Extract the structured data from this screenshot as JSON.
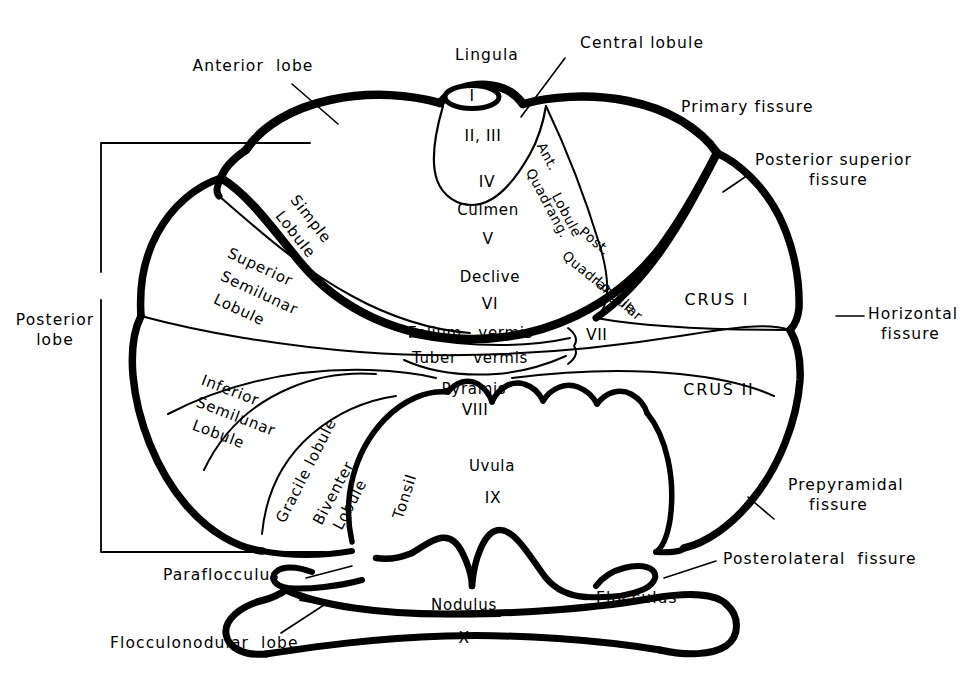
{
  "figure": {
    "ink": "#000000",
    "background": "#ffffff"
  },
  "lobe_brackets": [
    {
      "name": "anterior-lobe",
      "label": "Anterior  lobe"
    },
    {
      "name": "posterior-lobe",
      "label_line1": "Posterior",
      "label_line2": "lobe"
    },
    {
      "name": "flocculonodular-lobe",
      "label": "Flocculonodular  lobe"
    }
  ],
  "callouts": {
    "anterior_lobe": "Anterior  lobe",
    "lingula": "Lingula",
    "central_lobule": "Central lobule",
    "primary_fissure": "Primary fissure",
    "posterior_superior_fissure_l1": "Posterior superior",
    "posterior_superior_fissure_l2": "fissure",
    "horizontal_fissure_l1": "Horizontal",
    "horizontal_fissure_l2": "fissure",
    "prepyramidal_fissure_l1": "Prepyramidal",
    "prepyramidal_fissure_l2": "fissure",
    "posterolateral_fissure": "Posterolateral  fissure",
    "paraflocculus": "Paraflocculus",
    "flocculonodular_lobe": "Flocculonodular  lobe",
    "posterior_lobe_l1": "Posterior",
    "posterior_lobe_l2": "lobe"
  },
  "hemisphere_regions": {
    "simple_lobule_l1": "Simple",
    "simple_lobule_l2": "Lobule",
    "superior_semilunar_l1": "Superior",
    "superior_semilunar_l2": "Semilunar",
    "superior_semilunar_l3": "Lobule",
    "inferior_semilunar_l1": "Inferior",
    "inferior_semilunar_l2": "Semilunar",
    "inferior_semilunar_l3": "Lobule",
    "gracile_lobule": "Gracile lobule",
    "biventer_l1": "Biventer",
    "biventer_l2": "Lobule",
    "tonsil": "Tonsil",
    "ant_quadrangular_l1": "Ant.",
    "ant_quadrangular_l2": "Quadrang.",
    "ant_quadrangular_l3": "Lobule",
    "post_quadrangular_l1": "Post.",
    "post_quadrangular_l2": "Quadrangular",
    "post_quadrangular_l3": "Lobule",
    "crus_i": "CRUS I",
    "crus_ii": "CRUS II",
    "flocculus": "Flocculus"
  },
  "vermis_segments": [
    {
      "name": "lingula",
      "label": "",
      "roman": "I"
    },
    {
      "name": "central-lobule",
      "label": "",
      "roman": "II, III"
    },
    {
      "name": "culmen",
      "label": "Culmen",
      "roman_above": "IV",
      "roman_below": "V"
    },
    {
      "name": "declive",
      "label": "Declive",
      "roman": "VI"
    },
    {
      "name": "folium-vermis",
      "label": "Folium   vermis",
      "roman": "VII"
    },
    {
      "name": "tuber-vermis",
      "label": "Tuber   vermis",
      "roman": ""
    },
    {
      "name": "pyramis",
      "label": "Pyramis",
      "roman": "VIII"
    },
    {
      "name": "uvula",
      "label": "Uvula",
      "roman": "IX"
    },
    {
      "name": "nodulus",
      "label": "Nodulus",
      "roman": "X"
    }
  ],
  "roman_numerals": {
    "i": "I",
    "ii_iii": "II, III",
    "iv": "IV",
    "v": "V",
    "vi": "VI",
    "vii": "VII",
    "viii": "VIII",
    "ix": "IX",
    "x": "X"
  },
  "vermis_names": {
    "culmen": "Culmen",
    "declive": "Declive",
    "folium_vermis": "Folium   vermis",
    "tuber_vermis": "Tuber   vermis",
    "pyramis": "Pyramis",
    "uvula": "Uvula",
    "nodulus": "Nodulus"
  }
}
